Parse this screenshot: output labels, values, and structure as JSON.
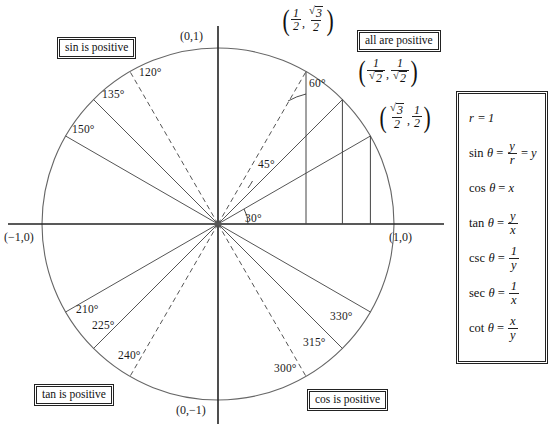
{
  "diagram": {
    "center_x": 218,
    "center_y": 224,
    "radius": 176
  },
  "axes": {
    "top_label": "(0,1)",
    "bottom_label": "(0,−1)",
    "left_label": "(−1,0)",
    "right_label": "(1,0)"
  },
  "quadrant_boxes": [
    {
      "name": "sin-is-positive",
      "text": "sin is positive",
      "x": 57,
      "y": 37
    },
    {
      "name": "all-are-positive",
      "text": "all are positive",
      "x": 357,
      "y": 30
    },
    {
      "name": "tan-is-positive",
      "text": "tan is positive",
      "x": 34,
      "y": 384
    },
    {
      "name": "cos-is-positive",
      "text": "cos is positive",
      "x": 307,
      "y": 389
    }
  ],
  "angles": [
    {
      "deg": 30,
      "label": "30°",
      "dashed": false,
      "lx": 245,
      "ly": 213
    },
    {
      "deg": 45,
      "label": "45°",
      "dashed": false,
      "lx": 258,
      "ly": 159
    },
    {
      "deg": 60,
      "label": "60°",
      "dashed": true,
      "lx": 309,
      "ly": 78
    },
    {
      "deg": 120,
      "label": "120°",
      "dashed": true,
      "lx": 139,
      "ly": 67
    },
    {
      "deg": 135,
      "label": "135°",
      "dashed": false,
      "lx": 102,
      "ly": 89
    },
    {
      "deg": 150,
      "label": "150°",
      "dashed": false,
      "lx": 72,
      "ly": 124
    },
    {
      "deg": 210,
      "label": "210°",
      "dashed": false,
      "lx": 76,
      "ly": 304
    },
    {
      "deg": 225,
      "label": "225°",
      "dashed": false,
      "lx": 92,
      "ly": 320
    },
    {
      "deg": 240,
      "label": "240°",
      "dashed": true,
      "lx": 118,
      "ly": 350
    },
    {
      "deg": 300,
      "label": "300°",
      "dashed": true,
      "lx": 274,
      "ly": 363
    },
    {
      "deg": 315,
      "label": "315°",
      "dashed": false,
      "lx": 303,
      "ly": 337
    },
    {
      "deg": 330,
      "label": "330°",
      "dashed": false,
      "lx": 330,
      "ly": 311
    }
  ],
  "coordinate_labels": [
    {
      "name": "coord-60",
      "x_num": "1",
      "x_den": "2",
      "y_num": "√3",
      "y_den": "2",
      "px": 281,
      "py": 6
    },
    {
      "name": "coord-45",
      "x_num": "1",
      "x_den": "√2",
      "y_num": "1",
      "y_den": "√2",
      "px": 357,
      "py": 57
    },
    {
      "name": "coord-30",
      "x_num": "√3",
      "x_den": "2",
      "y_num": "1",
      "y_den": "2",
      "px": 378,
      "py": 103
    }
  ],
  "formulas": [
    {
      "name": "r-equals-one",
      "fn": "r",
      "italic_fn": true,
      "eq": "=",
      "rhs_type": "plain",
      "rhs": "1"
    },
    {
      "name": "sin-formula",
      "fn": "sin",
      "italic_fn": false,
      "eq": "=",
      "rhs_type": "frac-eq",
      "num": "y",
      "den": "r",
      "tail_eq": "=",
      "tail": "y"
    },
    {
      "name": "cos-formula",
      "fn": "cos",
      "italic_fn": false,
      "eq": "=",
      "rhs_type": "plain",
      "rhs": "x"
    },
    {
      "name": "tan-formula",
      "fn": "tan",
      "italic_fn": false,
      "eq": "=",
      "rhs_type": "frac",
      "num": "y",
      "den": "x"
    },
    {
      "name": "csc-formula",
      "fn": "csc",
      "italic_fn": false,
      "eq": "=",
      "rhs_type": "frac",
      "num": "1",
      "den": "y"
    },
    {
      "name": "sec-formula",
      "fn": "sec",
      "italic_fn": false,
      "eq": "=",
      "rhs_type": "frac",
      "num": "1",
      "den": "x"
    },
    {
      "name": "cot-formula",
      "fn": "cot",
      "italic_fn": false,
      "eq": "=",
      "rhs_type": "frac",
      "num": "x",
      "den": "y"
    }
  ],
  "colors": {
    "ink": "#1a1a1a",
    "line": "#555555",
    "axis": "#222222",
    "background": "#ffffff"
  }
}
